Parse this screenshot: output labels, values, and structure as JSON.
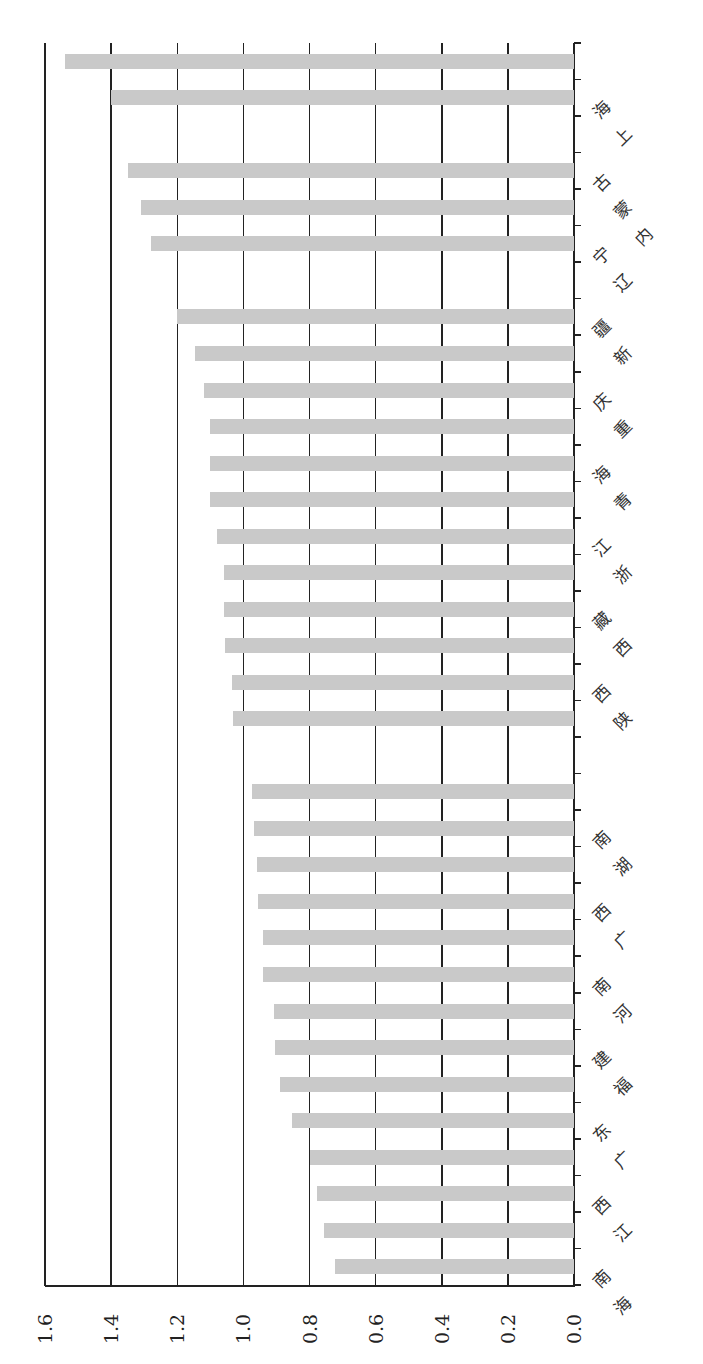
{
  "chart_data": {
    "type": "bar",
    "orientation": "rotated-90 (horizontal bars growing leftward from axis at right)",
    "title": "",
    "xlabel": "",
    "ylabel": "",
    "ylim": [
      0.0,
      1.6
    ],
    "value_ticks": [
      "1.6",
      "1.4",
      "1.2",
      "1.0",
      "0.8",
      "0.6",
      "0.4",
      "0.2",
      "0.0"
    ],
    "grid": true,
    "legend": null,
    "bar_color": "#c9c9c9",
    "categories": [
      "",
      "上海",
      "",
      "内蒙古",
      "",
      "辽宁",
      "",
      "新疆",
      "",
      "重庆",
      "",
      "青海",
      "",
      "浙江",
      "",
      "西藏",
      "",
      "陕西",
      "",
      "",
      "",
      "湖南",
      "",
      "广西",
      "",
      "河南",
      "",
      "福建",
      "",
      "广东",
      "",
      "江西",
      "",
      "海南"
    ],
    "values": [
      1.54,
      1.4,
      null,
      1.35,
      1.31,
      1.28,
      null,
      1.2,
      1.145,
      1.12,
      1.1,
      1.1,
      1.1,
      1.08,
      1.06,
      1.06,
      1.055,
      1.035,
      1.03,
      null,
      0.975,
      0.967,
      0.96,
      0.957,
      0.942,
      0.941,
      0.906,
      0.905,
      0.889,
      0.854,
      0.8,
      0.776,
      0.756,
      0.723
    ]
  }
}
